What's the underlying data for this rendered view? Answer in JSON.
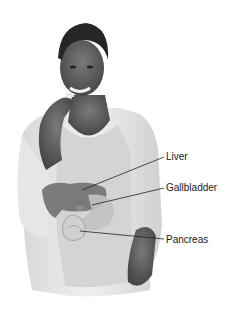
{
  "illustration": {
    "subject": "woman-eating-with-digestive-organs-overlay",
    "labels": [
      {
        "text": "Liver",
        "x": 166,
        "y": 151
      },
      {
        "text": "Gallbladder",
        "x": 166,
        "y": 182
      },
      {
        "text": "Pancreas",
        "x": 166,
        "y": 234
      }
    ]
  },
  "colors": {
    "background": "#ffffff",
    "skin": "#5a5a5a",
    "hair": "#2a2a2a",
    "cardigan": "#e4e4e4",
    "top": "#cfcfcf",
    "organ_liver": "#6e6e6e",
    "organ_stomach": "#bdbdbd",
    "leader_line": "#222222",
    "label_text": "#1a1a1a"
  }
}
